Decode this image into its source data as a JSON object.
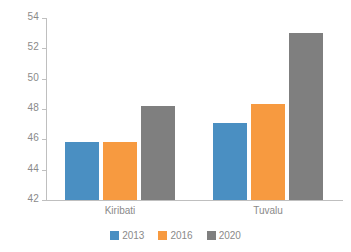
{
  "chart_data": {
    "type": "bar",
    "title": "",
    "subtitle": "",
    "xlabel": "",
    "ylabel": "",
    "categories": [
      "Kiribati",
      "Tuvalu"
    ],
    "series": [
      {
        "name": "2013",
        "color": "#4a8fc2",
        "values": [
          45.8,
          47.1
        ]
      },
      {
        "name": "2016",
        "color": "#f79a40",
        "values": [
          45.8,
          48.3
        ]
      },
      {
        "name": "2020",
        "color": "#7f7f7f",
        "values": [
          48.2,
          53.0
        ]
      }
    ],
    "ylim": [
      42,
      54
    ],
    "yticks": [
      42,
      44,
      46,
      48,
      50,
      52,
      54
    ],
    "ytick_labels": [
      "42",
      "44",
      "46",
      "48",
      "50",
      "52",
      "54"
    ],
    "grid": false,
    "legend_position": "bottom",
    "annotations": []
  },
  "axis": {
    "y_tick_labels": [
      "42",
      "44",
      "46",
      "48",
      "50",
      "52",
      "54"
    ],
    "axis_color": "#bfbfbf",
    "label_color": "#8a8a8a"
  },
  "legend": {
    "items": [
      {
        "label": "2013",
        "color": "#4a8fc2"
      },
      {
        "label": "2016",
        "color": "#f79a40"
      },
      {
        "label": "2020",
        "color": "#7f7f7f"
      }
    ]
  },
  "categories": [
    {
      "label": "Kiribati"
    },
    {
      "label": "Tuvalu"
    }
  ]
}
